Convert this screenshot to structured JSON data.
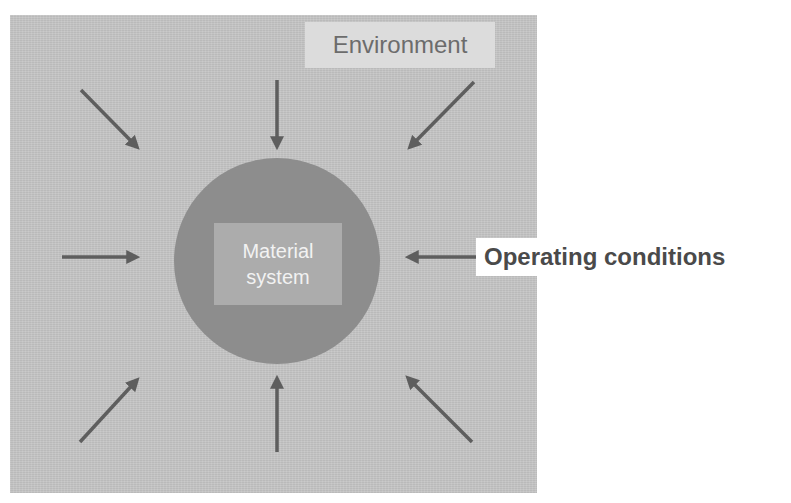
{
  "diagram": {
    "environment_label": "Environment",
    "core": {
      "line1": "Material",
      "line2": "system"
    },
    "operating_label": "Operating conditions",
    "arrows": [
      {
        "name": "arrow-top-left",
        "from": [
          81,
          90
        ],
        "to": [
          140,
          150
        ]
      },
      {
        "name": "arrow-top",
        "from": [
          277,
          80
        ],
        "to": [
          277,
          150
        ]
      },
      {
        "name": "arrow-top-right",
        "from": [
          474,
          82
        ],
        "to": [
          407,
          150
        ]
      },
      {
        "name": "arrow-left",
        "from": [
          62,
          257
        ],
        "to": [
          140,
          257
        ]
      },
      {
        "name": "arrow-right",
        "from": [
          482,
          257
        ],
        "to": [
          405,
          257
        ]
      },
      {
        "name": "arrow-bottom-left",
        "from": [
          80,
          442
        ],
        "to": [
          140,
          377
        ]
      },
      {
        "name": "arrow-bottom",
        "from": [
          277,
          452
        ],
        "to": [
          277,
          375
        ]
      },
      {
        "name": "arrow-bottom-right",
        "from": [
          472,
          442
        ],
        "to": [
          405,
          375
        ]
      }
    ],
    "colors": {
      "panel": "#c4c4c4",
      "circle": "#8d8d8d",
      "core_box": "#acacac",
      "arrow": "#5e5e5e",
      "env_label_bg": "#dcdcdc"
    }
  }
}
